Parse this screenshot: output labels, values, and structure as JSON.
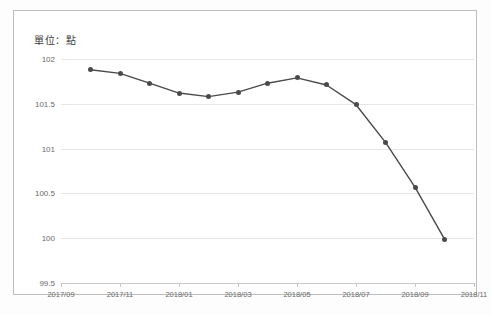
{
  "unit_label": "單位：點",
  "colors": {
    "line": "#4a4a4a",
    "marker": "#4a4a4a",
    "grid": "#e6e6e6",
    "axis": "#c8c8c8",
    "frame": "#bdbdbd",
    "tick_text": "#6a6a6a",
    "background": "#ffffff"
  },
  "chart_data": {
    "type": "line",
    "title": "",
    "subtitle": "",
    "xlabel": "",
    "ylabel": "單位：點",
    "ylim": [
      99.5,
      102.0
    ],
    "ytick_labels": [
      "102",
      "101.5",
      "101",
      "100.5",
      "100",
      "99.5"
    ],
    "ytick_values": [
      102,
      101.5,
      101,
      100.5,
      100,
      99.5
    ],
    "xtick_labels": [
      "2017/09",
      "2017/11",
      "2018/01",
      "2018/03",
      "2018/05",
      "2018/07",
      "2018/09",
      "2018/11"
    ],
    "grid": true,
    "legend": null,
    "x": [
      "2017/10",
      "2017/11",
      "2017/12",
      "2018/01",
      "2018/02",
      "2018/03",
      "2018/04",
      "2018/05",
      "2018/06",
      "2018/07",
      "2018/08",
      "2018/09",
      "2018/10"
    ],
    "values": [
      101.88,
      101.84,
      101.73,
      101.62,
      101.58,
      101.63,
      101.73,
      101.79,
      101.71,
      101.49,
      101.07,
      100.57,
      99.99
    ],
    "series": [
      {
        "name": "指數",
        "values": [
          101.88,
          101.84,
          101.73,
          101.62,
          101.58,
          101.63,
          101.73,
          101.79,
          101.71,
          101.49,
          101.07,
          100.57,
          99.99
        ]
      }
    ]
  }
}
